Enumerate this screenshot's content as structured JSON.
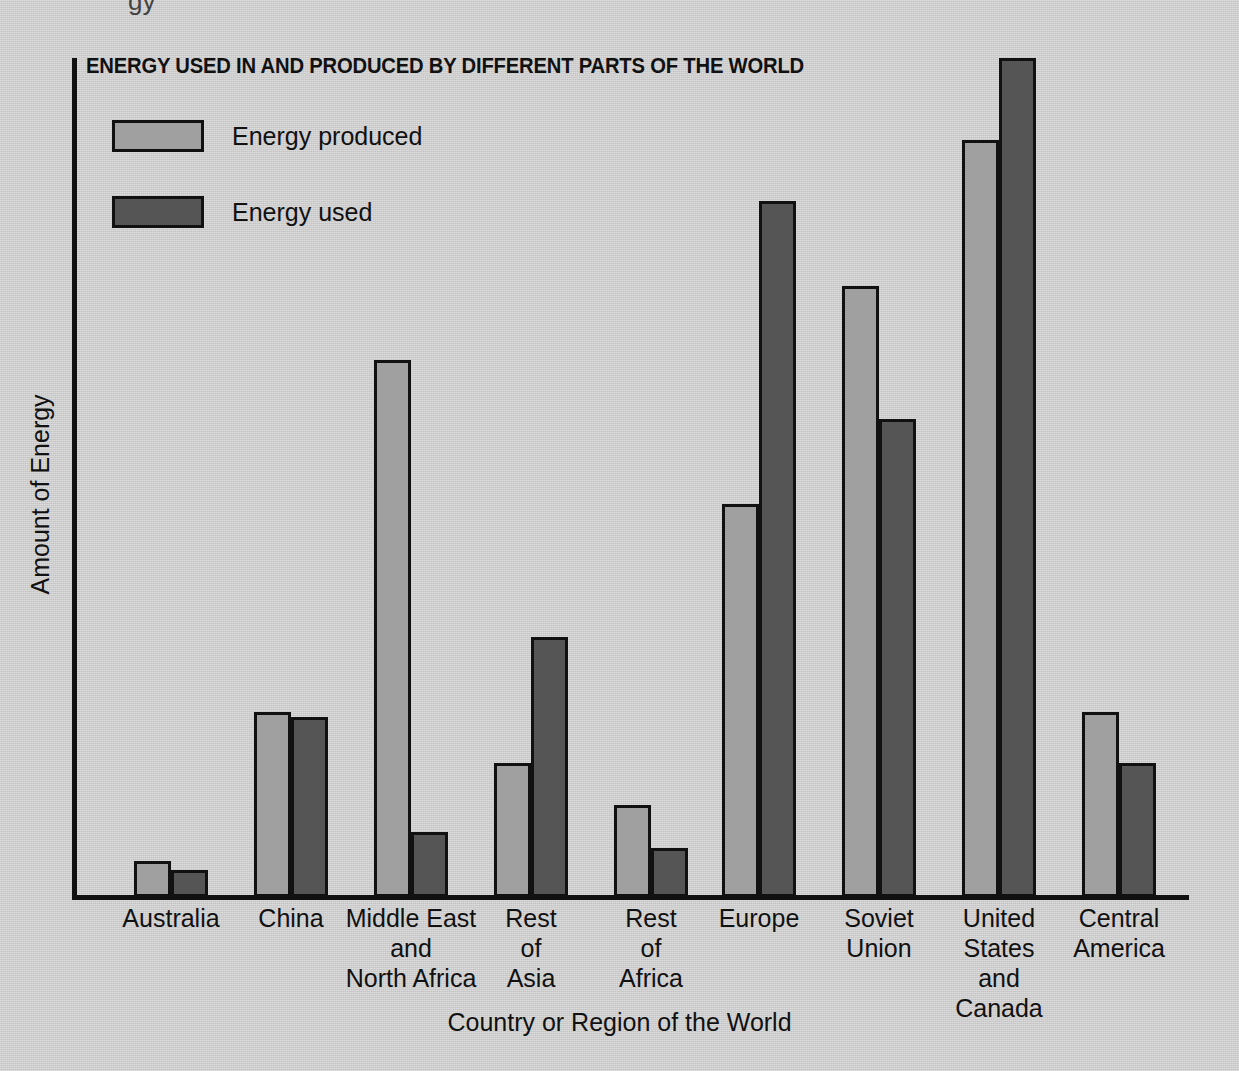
{
  "chart_data": {
    "type": "bar",
    "title": "ENERGY USED IN AND PRODUCED BY DIFFERENT PARTS OF THE WORLD",
    "xlabel": "Country or Region of the World",
    "ylabel": "Amount of Energy",
    "grid": false,
    "legend_position": "top-left",
    "ylim": [
      0,
      100
    ],
    "axis_ticks": [],
    "categories": [
      "Australia",
      "China",
      "Middle East\nand\nNorth Africa",
      "Rest\nof\nAsia",
      "Rest\nof\nAfrica",
      "Europe",
      "Soviet\nUnion",
      "United\nStates\nand\nCanada",
      "Central\nAmerica"
    ],
    "series": [
      {
        "name": "Energy produced",
        "color": "#a0a0a0",
        "values": [
          4.3,
          22.1,
          64.0,
          16.0,
          11.0,
          46.8,
          72.8,
          90.2,
          22.1
        ]
      },
      {
        "name": "Energy used",
        "color": "#555555",
        "values": [
          3.2,
          21.5,
          7.7,
          31.0,
          5.9,
          83.0,
          57.0,
          100.0,
          16.0
        ]
      }
    ]
  },
  "legend": {
    "items": [
      {
        "label": "Energy produced",
        "swatch": "#a0a0a0"
      },
      {
        "label": "Energy used",
        "swatch": "#555555"
      }
    ]
  },
  "artifacts": {
    "cropped_text_top": "gy"
  }
}
